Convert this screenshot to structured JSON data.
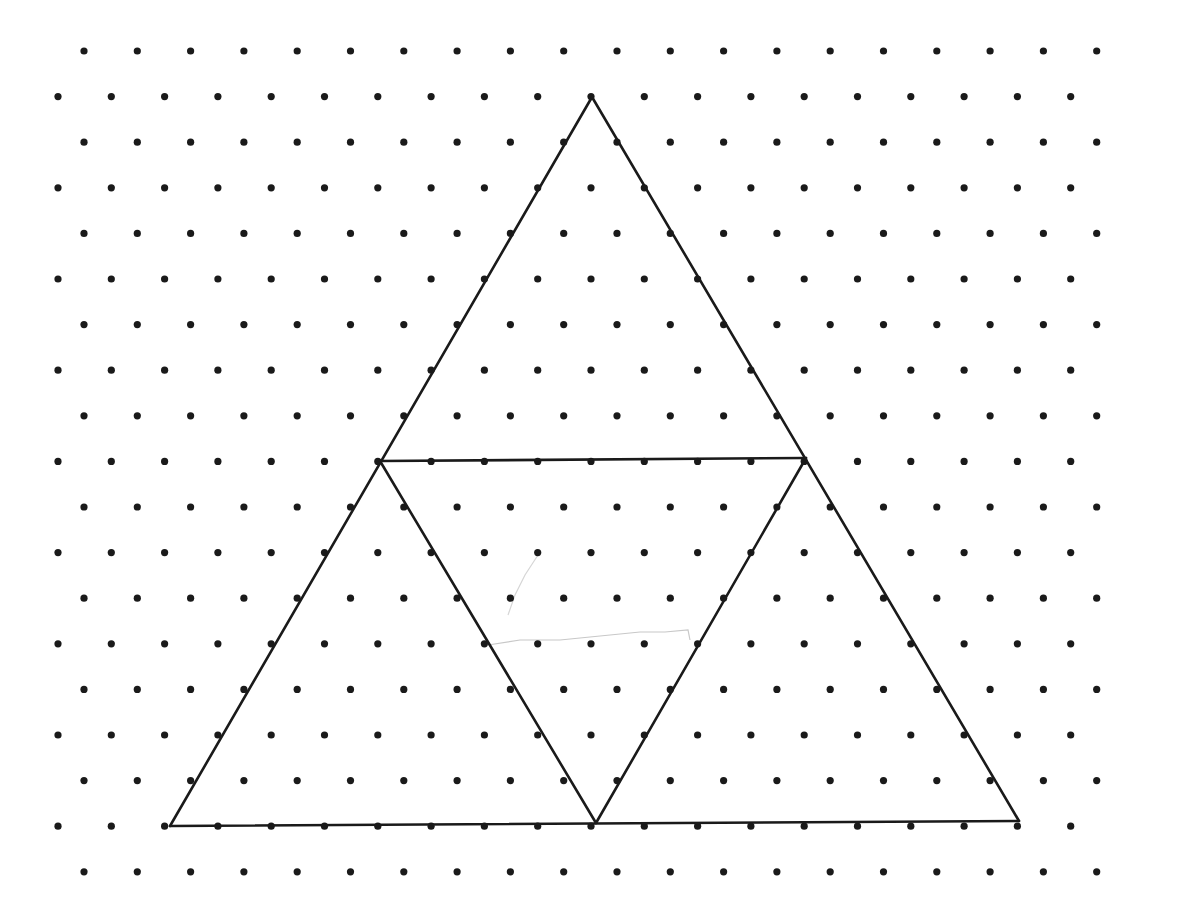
{
  "diagram": {
    "type": "isometric-dot-grid-with-triangles",
    "background": "#ffffff",
    "dot_color": "#1a1a1a",
    "line_color": "#1a1a1a",
    "dot_radius": 3.6,
    "line_width": 2.6,
    "grid": {
      "rows": 19,
      "cols": 20,
      "row_start_y": 51,
      "row_spacing": 45.6,
      "even_row_start_x": 84,
      "odd_row_start_x": 58,
      "col_spacing": 53.3
    },
    "vertices": {
      "apex": [
        592,
        97
      ],
      "mid_left": [
        380,
        461
      ],
      "mid_right": [
        806,
        458
      ],
      "bottom_left": [
        170,
        826
      ],
      "bottom_center": [
        596,
        823
      ],
      "bottom_right": [
        1019,
        821
      ]
    },
    "segments": [
      [
        "apex",
        "bottom_left"
      ],
      [
        "apex",
        "bottom_right"
      ],
      [
        "bottom_left",
        "bottom_right"
      ],
      [
        "mid_left",
        "mid_right"
      ],
      [
        "mid_left",
        "bottom_center"
      ],
      [
        "mid_right",
        "bottom_center"
      ]
    ],
    "pencil_marks": [
      {
        "points": [
          [
            488,
            645
          ],
          [
            520,
            640
          ],
          [
            560,
            640
          ],
          [
            600,
            636
          ],
          [
            640,
            632
          ],
          [
            665,
            632
          ],
          [
            688,
            630
          ],
          [
            690,
            640
          ]
        ],
        "color": "#c8c8c8"
      },
      {
        "points": [
          [
            508,
            615
          ],
          [
            515,
            595
          ],
          [
            525,
            575
          ],
          [
            538,
            555
          ]
        ],
        "color": "#d6d6d6"
      }
    ]
  }
}
